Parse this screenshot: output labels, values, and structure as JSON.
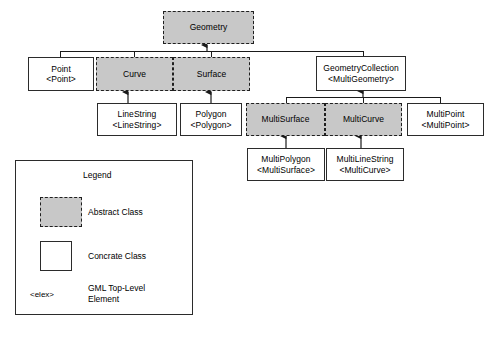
{
  "diagram": {
    "colors": {
      "abstract_fill": "#c8c8c8",
      "concrete_fill": "#ffffff",
      "stroke": "#2b2b2b",
      "background": "#ffffff"
    },
    "nodes": [
      {
        "id": "geometry",
        "name": "Geometry",
        "element": "",
        "kind": "abstract"
      },
      {
        "id": "point",
        "name": "Point",
        "element": "<Point>",
        "kind": "concrete"
      },
      {
        "id": "curve",
        "name": "Curve",
        "element": "",
        "kind": "abstract"
      },
      {
        "id": "surface",
        "name": "Surface",
        "element": "",
        "kind": "abstract"
      },
      {
        "id": "geometrycollection",
        "name": "GeometryCollection",
        "element": "<MultiGeometry>",
        "kind": "concrete"
      },
      {
        "id": "linestring",
        "name": "LineString",
        "element": "<LineString>",
        "kind": "concrete"
      },
      {
        "id": "polygon",
        "name": "Polygon",
        "element": "<Polygon>",
        "kind": "concrete"
      },
      {
        "id": "multisurface",
        "name": "MultiSurface",
        "element": "",
        "kind": "abstract"
      },
      {
        "id": "multicurve",
        "name": "MultiCurve",
        "element": "",
        "kind": "abstract"
      },
      {
        "id": "multipoint",
        "name": "MultiPoint",
        "element": "<MultiPoint>",
        "kind": "concrete"
      },
      {
        "id": "multipolygon",
        "name": "MultiPolygon",
        "element": "<MultiSurface>",
        "kind": "concrete"
      },
      {
        "id": "multilinestring",
        "name": "MultiLineString",
        "element": "<MultiCurve>",
        "kind": "concrete"
      }
    ],
    "generalizations": [
      {
        "from": "point",
        "to": "geometry"
      },
      {
        "from": "curve",
        "to": "geometry"
      },
      {
        "from": "surface",
        "to": "geometry"
      },
      {
        "from": "geometrycollection",
        "to": "geometry"
      },
      {
        "from": "linestring",
        "to": "curve"
      },
      {
        "from": "polygon",
        "to": "surface"
      },
      {
        "from": "multisurface",
        "to": "geometrycollection"
      },
      {
        "from": "multicurve",
        "to": "geometrycollection"
      },
      {
        "from": "multipoint",
        "to": "geometrycollection"
      },
      {
        "from": "multipolygon",
        "to": "multisurface"
      },
      {
        "from": "multilinestring",
        "to": "multicurve"
      }
    ]
  },
  "legend": {
    "title": "Legend",
    "abstract_label": "Abstract Class",
    "concrete_label": "Concrate Class",
    "elex_token": "<elex>",
    "elex_label": "GML Top-Level\nElement"
  }
}
